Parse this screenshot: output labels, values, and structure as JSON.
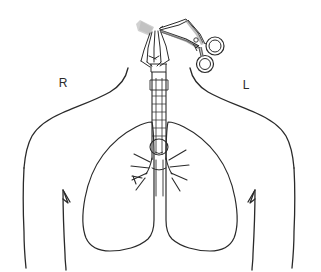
{
  "figure": {
    "type": "medical-line-illustration",
    "width": 321,
    "height": 272,
    "background_color": "#ffffff",
    "line_color": "#2a2a2a",
    "shading_color": "#c9c9c9"
  },
  "labels": {
    "right_side": "R",
    "left_side": "L"
  },
  "parts": {
    "torso": "torso-outline",
    "right_lung": "right-lung-outline",
    "left_lung": "left-lung-outline",
    "trachea": "trachea-tube",
    "carina": "carina",
    "bronchi": "bronchial-branches",
    "tracheostomy_tube": "tracheostomy-tube",
    "forceps": "surgical-forceps",
    "gauze": "gauze-pad",
    "retraction_sutures": "retraction-sutures"
  }
}
